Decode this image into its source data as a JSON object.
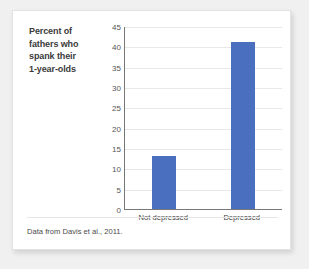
{
  "chart_data": {
    "type": "bar",
    "title": "Percent of fathers who spank their 1-year-olds",
    "title_lines": [
      "Percent of",
      "fathers who",
      "spank their",
      "1-year-olds"
    ],
    "categories": [
      "Not depressed",
      "Depressed"
    ],
    "values": [
      13,
      41
    ],
    "xlabel": "",
    "ylabel": "",
    "ylim": [
      0,
      45
    ],
    "ytick_step": 5,
    "yticks": [
      45,
      40,
      35,
      30,
      25,
      20,
      15,
      10,
      5,
      0
    ],
    "ytick_labels": [
      "45",
      "40",
      "35",
      "30",
      "25",
      "20",
      "15",
      "10",
      "5",
      "0"
    ],
    "grid": true,
    "grid_axis": "y",
    "legend": false,
    "bar_color": "#4a6fbf",
    "source_note": "Data from Davis et al., 2011."
  },
  "card": {
    "background": "#ffffff",
    "border_color": "#e2e2e2"
  },
  "page": {
    "background": "#f0f0f0"
  }
}
